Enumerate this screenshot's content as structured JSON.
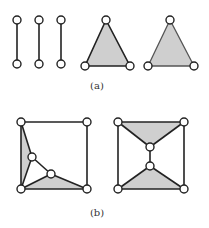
{
  "figure": {
    "panels": [
      {
        "id": "a",
        "caption": "(a)",
        "description": "Three isolated edges and two filled triangles",
        "components": [
          {
            "type": "edge",
            "vertices": [
              [
                17,
                20
              ],
              [
                17,
                64
              ]
            ]
          },
          {
            "type": "edge",
            "vertices": [
              [
                39,
                20
              ],
              [
                39,
                64
              ]
            ]
          },
          {
            "type": "edge",
            "vertices": [
              [
                61,
                20
              ],
              [
                61,
                64
              ]
            ]
          },
          {
            "type": "filled-triangle",
            "vertices": [
              [
                106,
                20
              ],
              [
                85,
                66
              ],
              [
                130,
                66
              ]
            ],
            "edge_style": "dark"
          },
          {
            "type": "filled-triangle",
            "vertices": [
              [
                170,
                20
              ],
              [
                148,
                66
              ],
              [
                194,
                66
              ]
            ],
            "edge_style": "light"
          }
        ]
      },
      {
        "id": "b",
        "caption": "(b)",
        "description": "Two square graphs with internal vertices and shaded triangular faces",
        "components": [
          {
            "type": "graph",
            "vertices": 6
          },
          {
            "type": "graph",
            "vertices": 6
          }
        ]
      }
    ],
    "colors": {
      "edge": "#222222",
      "face": "#cfcfcf",
      "vertex_fill": "#ffffff",
      "background": "#ffffff"
    }
  }
}
